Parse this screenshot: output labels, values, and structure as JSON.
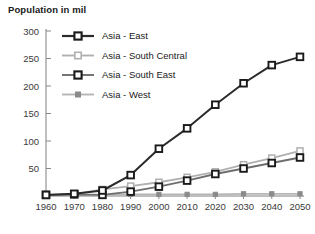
{
  "chart_data": {
    "type": "line",
    "title": "Population in mil",
    "xlabel": "",
    "ylabel": "",
    "x": [
      1960,
      1970,
      1980,
      1990,
      2000,
      2010,
      2020,
      2030,
      2040,
      2050
    ],
    "categories": [
      "1960",
      "1970",
      "1980",
      "1990",
      "2000",
      "2010",
      "2020",
      "2030",
      "2040",
      "2050"
    ],
    "xlim": [
      1960,
      2050
    ],
    "ylim": [
      0,
      300
    ],
    "yticks": [
      0,
      50,
      100,
      150,
      200,
      250,
      300
    ],
    "ytick_labels": [
      "",
      "50",
      "100",
      "150",
      "200",
      "250",
      "300"
    ],
    "grid": false,
    "legend_position": "top-left-inside",
    "series": [
      {
        "name": "Asia - East",
        "values": [
          2,
          4,
          10,
          38,
          86,
          123,
          166,
          205,
          238,
          253
        ],
        "color": "#2b2b2b",
        "marker": "square-open",
        "marker_fill": "#ffffff",
        "marker_stroke": "#1a1a1a"
      },
      {
        "name": "Asia - South Central",
        "values": [
          2,
          3,
          12,
          18,
          25,
          34,
          44,
          57,
          69,
          82
        ],
        "color": "#b0b0b0",
        "marker": "square-open",
        "marker_fill": "#ffffff",
        "marker_stroke": "#b0b0b0"
      },
      {
        "name": "Asia - South East",
        "values": [
          2,
          3,
          2,
          8,
          17,
          28,
          40,
          50,
          60,
          70
        ],
        "color": "#6e6e6e",
        "marker": "square-open",
        "marker_fill": "#ffffff",
        "marker_stroke": "#1a1a1a"
      },
      {
        "name": "Asia - West",
        "values": [
          1,
          1,
          2,
          3,
          3,
          3,
          3,
          4,
          4,
          4
        ],
        "color": "#b5b5b5",
        "marker": "square-filled",
        "marker_fill": "#8a8a8a",
        "marker_stroke": "#8a8a8a"
      }
    ]
  },
  "legend": {
    "entries": [
      {
        "label": "Asia - East"
      },
      {
        "label": "Asia - South Central"
      },
      {
        "label": "Asia - South East"
      },
      {
        "label": "Asia - West"
      }
    ]
  },
  "colors": {
    "axis": "#808080",
    "text": "#1a1a1a",
    "tick_text": "#3a3a3a",
    "background": "#ffffff"
  }
}
